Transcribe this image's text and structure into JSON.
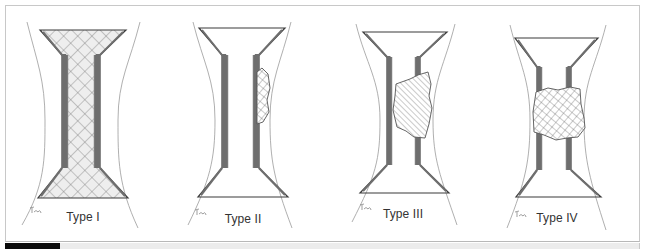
{
  "figure": {
    "colors": {
      "line": "#3a3a3a",
      "band": "#6e6e6e",
      "outline": "#9a9a9a",
      "hatch": "#7a7a7a",
      "fill_tint": "#eeeeee"
    },
    "panels": [
      {
        "id": "type-1",
        "label": "Type I",
        "label_pos": [
          83,
          210
        ],
        "top": {
          "y": 30,
          "x1": 40,
          "x2": 126
        },
        "bottom": {
          "y": 198,
          "x1": 38,
          "x2": 128
        },
        "inner": {
          "y1": 55,
          "y2": 168,
          "x1": 62,
          "x2": 100
        },
        "band_width": 6,
        "outline": {
          "left": [
            27,
            22,
            45,
            120,
            45,
            205,
            22,
            225
          ],
          "right": [
            140,
            22,
            118,
            120,
            118,
            205,
            138,
            228
          ]
        },
        "defect": {
          "kind": "full",
          "hatch": "cross"
        },
        "signature_pos": [
          30,
          208
        ]
      },
      {
        "id": "type-2",
        "label": "Type II",
        "label_pos": [
          243,
          212
        ],
        "top": {
          "y": 28,
          "x1": 199,
          "x2": 285
        },
        "bottom": {
          "y": 197,
          "x1": 198,
          "x2": 288
        },
        "inner": {
          "y1": 55,
          "y2": 168,
          "x1": 222,
          "x2": 259
        },
        "band_width": 6,
        "outline": {
          "left": [
            193,
            22,
            215,
            120,
            210,
            200,
            188,
            225
          ],
          "right": [
            291,
            22,
            270,
            120,
            274,
            200,
            292,
            228
          ]
        },
        "defect": {
          "kind": "patch",
          "hatch": "cross",
          "path": "M257,72 L262,68 L268,74 L270,88 L267,100 L269,112 L263,122 L257,124 Z"
        },
        "signature_pos": [
          195,
          210
        ]
      },
      {
        "id": "type-3",
        "label": "Type III",
        "label_pos": [
          403,
          207
        ],
        "top": {
          "y": 32,
          "x1": 363,
          "x2": 447
        },
        "bottom": {
          "y": 193,
          "x1": 360,
          "x2": 449
        },
        "inner": {
          "y1": 57,
          "y2": 165,
          "x1": 387,
          "x2": 420
        },
        "band_width": 5,
        "outline": {
          "left": [
            356,
            24,
            380,
            120,
            376,
            195,
            352,
            222
          ],
          "right": [
            455,
            24,
            433,
            120,
            440,
            195,
            457,
            225
          ]
        },
        "defect": {
          "kind": "patch",
          "hatch": "diag",
          "path": "M396,84 L410,79 L418,75 L428,72 L431,84 L429,96 L432,108 L429,124 L425,138 L414,137 L406,131 L397,127 L393,110 L395,96 Z"
        },
        "signature_pos": [
          360,
          205
        ]
      },
      {
        "id": "type-4",
        "label": "Type IV",
        "label_pos": [
          557,
          211
        ],
        "top": {
          "y": 38,
          "x1": 515,
          "x2": 598
        },
        "bottom": {
          "y": 197,
          "x1": 516,
          "x2": 601
        },
        "inner": {
          "y1": 67,
          "y2": 170,
          "x1": 537,
          "x2": 571
        },
        "band_width": 5,
        "outline": {
          "left": [
            510,
            25,
            530,
            120,
            526,
            200,
            507,
            228
          ],
          "right": [
            606,
            25,
            584,
            120,
            590,
            200,
            606,
            230
          ]
        },
        "defect": {
          "kind": "patch",
          "hatch": "cross",
          "path": "M536,92 L548,88 L558,90 L570,87 L580,89 L581,104 L584,118 L585,128 L578,137 L567,138 L556,140 L544,135 L534,132 L533,112 Z"
        },
        "signature_pos": [
          515,
          212
        ]
      }
    ]
  }
}
